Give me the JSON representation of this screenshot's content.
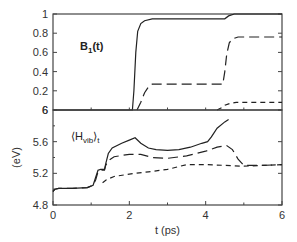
{
  "chart_data": [
    {
      "type": "line",
      "panel": "top",
      "annotation": {
        "main": "B",
        "sub": "1",
        "suffix": "(t)"
      },
      "xlabel": "",
      "ylabel": "",
      "xlim": [
        0,
        6
      ],
      "ylim": [
        0,
        1
      ],
      "yticks": [
        0,
        0.2,
        0.4,
        0.6,
        0.8,
        1
      ],
      "ytick_labels": [
        "6",
        "0.2",
        "0.4",
        "0.6",
        "0.8",
        "1"
      ],
      "xticks_minor": [
        1,
        2,
        3,
        4,
        5
      ],
      "series": [
        {
          "name": "solid",
          "style": "solid",
          "x": [
            0,
            2.08,
            2.12,
            2.17,
            2.22,
            2.3,
            2.4,
            2.6,
            3.0,
            4.0,
            4.5,
            4.6,
            4.75,
            6.0
          ],
          "y": [
            0,
            0,
            0.2,
            0.6,
            0.82,
            0.9,
            0.93,
            0.95,
            0.95,
            0.95,
            0.95,
            0.98,
            1.0,
            1.0
          ]
        },
        {
          "name": "long-dashed",
          "style": "long-dash",
          "x": [
            2.2,
            2.3,
            2.4,
            2.5,
            2.6,
            3.0,
            4.0,
            4.45,
            4.5,
            4.55,
            4.62,
            4.7,
            4.85,
            6.0
          ],
          "y": [
            0,
            0.08,
            0.18,
            0.24,
            0.27,
            0.27,
            0.27,
            0.27,
            0.4,
            0.58,
            0.7,
            0.74,
            0.76,
            0.76
          ]
        },
        {
          "name": "short-dashed",
          "style": "short-dash",
          "x": [
            4.3,
            4.4,
            4.5,
            4.65,
            4.8,
            5.0,
            6.0
          ],
          "y": [
            0,
            0.02,
            0.05,
            0.07,
            0.08,
            0.08,
            0.08
          ]
        }
      ]
    },
    {
      "type": "line",
      "panel": "bottom",
      "annotation": {
        "main": "⟨H",
        "sub": "vib",
        "suffix": "⟩",
        "sub2": "t"
      },
      "xlabel": "t (ps)",
      "ylabel": "(eV)",
      "xlim": [
        0,
        6
      ],
      "ylim": [
        4.8,
        6
      ],
      "xticks": [
        0,
        2,
        4,
        6
      ],
      "xtick_labels": [
        "0",
        "2",
        "4",
        "6"
      ],
      "xticks_minor": [
        1,
        3,
        5
      ],
      "yticks": [
        4.8,
        5.2,
        5.6,
        6
      ],
      "ytick_labels": [
        "4.8",
        "5.2",
        "5.6",
        "6"
      ],
      "yticks_minor": [
        5.0,
        5.4,
        5.8
      ],
      "series": [
        {
          "name": "solid",
          "style": "solid",
          "x": [
            0,
            0.05,
            0.15,
            0.5,
            0.9,
            1.05,
            1.12,
            1.18,
            1.25,
            1.35,
            1.38,
            1.45,
            1.55,
            1.8,
            2.0,
            2.15,
            2.3,
            2.5,
            2.7,
            3.0,
            3.3,
            3.6,
            3.9,
            4.05,
            4.15,
            4.3,
            4.5,
            4.6
          ],
          "y": [
            4.97,
            5.0,
            5.01,
            5.01,
            5.02,
            5.05,
            5.15,
            5.24,
            5.25,
            5.25,
            5.32,
            5.45,
            5.52,
            5.58,
            5.62,
            5.65,
            5.58,
            5.52,
            5.5,
            5.49,
            5.5,
            5.53,
            5.58,
            5.6,
            5.66,
            5.77,
            5.85,
            5.88
          ]
        },
        {
          "name": "long-dashed",
          "style": "long-dash",
          "x": [
            0,
            0.05,
            0.15,
            0.5,
            0.9,
            1.05,
            1.12,
            1.18,
            1.25,
            1.35,
            1.38,
            1.45,
            1.6,
            2.0,
            2.3,
            2.6,
            3.0,
            3.5,
            4.0,
            4.3,
            4.55,
            4.7,
            4.85,
            5.0,
            5.5,
            6.0
          ],
          "y": [
            4.97,
            5.0,
            5.01,
            5.01,
            5.02,
            5.05,
            5.12,
            5.22,
            5.24,
            5.24,
            5.3,
            5.36,
            5.41,
            5.44,
            5.44,
            5.4,
            5.39,
            5.42,
            5.48,
            5.53,
            5.55,
            5.5,
            5.38,
            5.3,
            5.3,
            5.31
          ]
        },
        {
          "name": "short-dashed",
          "style": "short-dash",
          "x": [
            1.3,
            1.4,
            1.6,
            2.0,
            2.5,
            3.0,
            3.5,
            4.0,
            4.5,
            5.0,
            5.5,
            6.0
          ],
          "y": [
            5.08,
            5.12,
            5.16,
            5.19,
            5.22,
            5.25,
            5.31,
            5.31,
            5.3,
            5.29,
            5.3,
            5.31
          ]
        }
      ]
    }
  ]
}
